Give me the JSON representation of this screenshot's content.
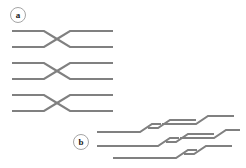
{
  "figure": {
    "background_color": "#ffffff",
    "stroke_color": "#808080",
    "stroke_width": 2.1,
    "width": 246,
    "height": 168
  },
  "panels": [
    {
      "id": "a",
      "label": "a",
      "label_shape": "circle",
      "label_cx": 18,
      "label_cy": 15,
      "label_r": 7.5,
      "description": "three stacked X-shaped crossing units of straight horizontal gray strands",
      "units": [
        {
          "name": "crossing-unit-1",
          "left_y_top": 31,
          "left_y_bottom": 47,
          "right_y_top": 31,
          "right_y_bottom": 47,
          "x_start": 12,
          "x_flex_left": 44,
          "x_cross": 57,
          "x_flex_right": 70,
          "x_end": 113,
          "cross_y": 39
        },
        {
          "name": "crossing-unit-2",
          "left_y_top": 63,
          "left_y_bottom": 79,
          "right_y_top": 63,
          "right_y_bottom": 79,
          "x_start": 12,
          "x_flex_left": 44,
          "x_cross": 57,
          "x_flex_right": 70,
          "x_end": 113,
          "cross_y": 71
        },
        {
          "name": "crossing-unit-3",
          "left_y_top": 95,
          "left_y_bottom": 111,
          "right_y_top": 95,
          "right_y_bottom": 111,
          "x_start": 12,
          "x_flex_left": 44,
          "x_cross": 57,
          "x_flex_right": 70,
          "x_end": 113,
          "cross_y": 103
        }
      ]
    },
    {
      "id": "b",
      "label": "b",
      "label_shape": "circle",
      "label_cx": 81,
      "label_cy": 142,
      "label_r": 7.5,
      "description": "same crossing motif sheared diagonally, strands stepping up to the right",
      "units": [
        {
          "name": "sheared-unit-1",
          "polyline": "97,132 140,132 152,124 183,124"
        },
        {
          "name": "sheared-unit-2",
          "polyline": "97,146 158,146 170,138 183,138"
        },
        {
          "name": "sheared-unit-3",
          "polyline": "113,152 176,152 188,144 200,144"
        },
        {
          "name": "sheared-unit-4",
          "polyline": "146,124 158,124 170,132 233,132"
        },
        {
          "name": "sheared-unit-5",
          "polyline": "164,139 176,139 188,131 233,131"
        },
        {
          "name": "sheared-unit-6",
          "polyline": "182,146 194,146 206,138 240,138"
        }
      ]
    }
  ]
}
